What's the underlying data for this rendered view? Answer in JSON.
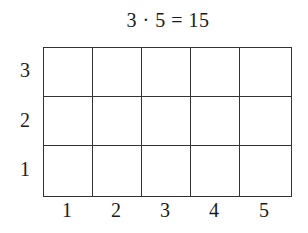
{
  "title": "3 · 5 = 15",
  "grid": {
    "rows": 3,
    "cols": 5,
    "line_color": "#333333"
  },
  "y_labels": [
    "3",
    "2",
    "1"
  ],
  "x_labels": [
    "1",
    "2",
    "3",
    "4",
    "5"
  ]
}
